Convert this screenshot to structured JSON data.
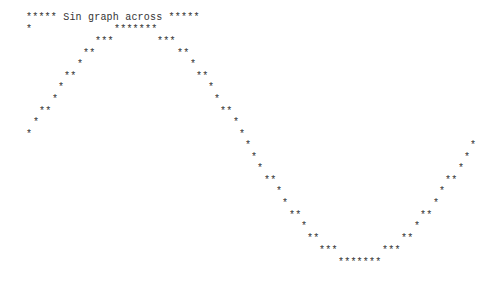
{
  "title": {
    "text": "***** Sin graph across *****",
    "x": 26,
    "y": 12
  },
  "rows": [
    {
      "y": 24,
      "segments": [
        {
          "x": 26,
          "text": "*"
        },
        {
          "x": 114,
          "text": "*******"
        }
      ]
    },
    {
      "y": 36,
      "segments": [
        {
          "x": 95,
          "text": "***"
        },
        {
          "x": 157,
          "text": "***"
        }
      ]
    },
    {
      "y": 48,
      "segments": [
        {
          "x": 83,
          "text": "**"
        },
        {
          "x": 177,
          "text": "**"
        }
      ]
    },
    {
      "y": 59,
      "segments": [
        {
          "x": 77,
          "text": "*"
        },
        {
          "x": 190,
          "text": "*"
        }
      ]
    },
    {
      "y": 71,
      "segments": [
        {
          "x": 64,
          "text": "**"
        },
        {
          "x": 196,
          "text": "**"
        }
      ]
    },
    {
      "y": 82,
      "segments": [
        {
          "x": 58,
          "text": "*"
        },
        {
          "x": 208,
          "text": "*"
        }
      ]
    },
    {
      "y": 94,
      "segments": [
        {
          "x": 52,
          "text": "*"
        },
        {
          "x": 214,
          "text": "*"
        }
      ]
    },
    {
      "y": 106,
      "segments": [
        {
          "x": 39,
          "text": "**"
        },
        {
          "x": 220,
          "text": "**"
        }
      ]
    },
    {
      "y": 117,
      "segments": [
        {
          "x": 33,
          "text": "*"
        },
        {
          "x": 233,
          "text": "*"
        }
      ]
    },
    {
      "y": 129,
      "segments": [
        {
          "x": 26,
          "text": "*"
        },
        {
          "x": 239,
          "text": "*"
        }
      ]
    },
    {
      "y": 140,
      "segments": [
        {
          "x": 245,
          "text": "*"
        },
        {
          "x": 470,
          "text": "*"
        }
      ]
    },
    {
      "y": 152,
      "segments": [
        {
          "x": 251,
          "text": "*"
        },
        {
          "x": 464,
          "text": "*"
        }
      ]
    },
    {
      "y": 163,
      "segments": [
        {
          "x": 257,
          "text": "*"
        },
        {
          "x": 458,
          "text": "*"
        }
      ]
    },
    {
      "y": 175,
      "segments": [
        {
          "x": 264,
          "text": "**"
        },
        {
          "x": 445,
          "text": "**"
        }
      ]
    },
    {
      "y": 186,
      "segments": [
        {
          "x": 276,
          "text": "*"
        },
        {
          "x": 439,
          "text": "*"
        }
      ]
    },
    {
      "y": 198,
      "segments": [
        {
          "x": 282,
          "text": "*"
        },
        {
          "x": 433,
          "text": "*"
        }
      ]
    },
    {
      "y": 210,
      "segments": [
        {
          "x": 289,
          "text": "**"
        },
        {
          "x": 420,
          "text": "**"
        }
      ]
    },
    {
      "y": 221,
      "segments": [
        {
          "x": 301,
          "text": "*"
        },
        {
          "x": 414,
          "text": "*"
        }
      ]
    },
    {
      "y": 233,
      "segments": [
        {
          "x": 307,
          "text": "**"
        },
        {
          "x": 401,
          "text": "**"
        }
      ]
    },
    {
      "y": 245,
      "segments": [
        {
          "x": 319,
          "text": "***"
        },
        {
          "x": 382,
          "text": "***"
        }
      ]
    },
    {
      "y": 257,
      "segments": [
        {
          "x": 338,
          "text": "*******"
        }
      ]
    }
  ]
}
